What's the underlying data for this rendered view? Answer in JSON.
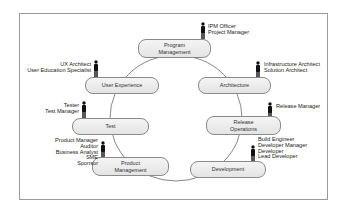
{
  "diagram": {
    "nodes": [
      {
        "id": "program-management",
        "label_lines": [
          "Program",
          "Management"
        ]
      },
      {
        "id": "user-experience",
        "label_lines": [
          "User Experience"
        ]
      },
      {
        "id": "architecture",
        "label_lines": [
          "Architecture"
        ]
      },
      {
        "id": "test",
        "label_lines": [
          "Test"
        ]
      },
      {
        "id": "release-operations",
        "label_lines": [
          "Release",
          "Operations"
        ]
      },
      {
        "id": "product-management",
        "label_lines": [
          "Product",
          "Management"
        ]
      },
      {
        "id": "development",
        "label_lines": [
          "Development"
        ]
      }
    ],
    "roles": {
      "program_management": [
        "IPM Officer",
        "Project Manager"
      ],
      "user_experience": [
        "UX Architect",
        "User Education Specialist"
      ],
      "architecture": [
        "Infrastructure Architect",
        "Solution Architect"
      ],
      "test": [
        "Tester",
        "Test Manager"
      ],
      "release_operations": [
        "Release Manager"
      ],
      "product_management": [
        "Product Manager",
        "Auditor",
        "Business Analyst",
        "SME",
        "Sponsor"
      ],
      "development": [
        "Build Engineer",
        "Developer Manager",
        "Developer",
        "Lead Developer"
      ]
    },
    "icons": {
      "person": "person-icon"
    },
    "colors": {
      "node_fill": "#ececec",
      "node_border": "#8a8a8a",
      "ring": "#555555",
      "frame": "#9a9a9a",
      "person": "#111111"
    }
  }
}
